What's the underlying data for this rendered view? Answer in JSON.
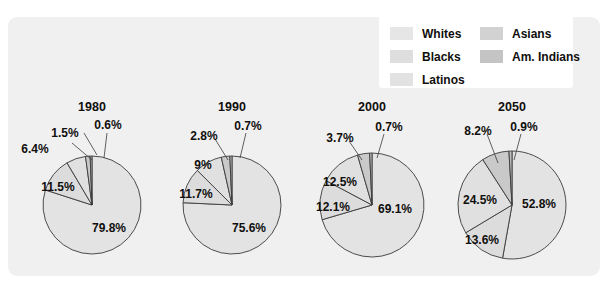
{
  "chart_data": {
    "type": "pie",
    "title": "",
    "subtitle": "",
    "xlabel": "",
    "ylabel": "",
    "grid": false,
    "legend_position": "top-right",
    "unit": "percent",
    "categories": [
      "Whites",
      "Blacks",
      "Latinos",
      "Asians",
      "Am. Indians"
    ],
    "panels": [
      {
        "label": "1980",
        "values": [
          79.8,
          11.5,
          6.4,
          1.5,
          0.6
        ],
        "value_labels": [
          "79.8%",
          "11.5%",
          "6.4%",
          "1.5%",
          "0.6%"
        ]
      },
      {
        "label": "1990",
        "values": [
          75.6,
          11.7,
          9.0,
          2.8,
          0.7
        ],
        "value_labels": [
          "75.6%",
          "11.7%",
          "9%",
          "2.8%",
          "0.7%"
        ]
      },
      {
        "label": "2000",
        "values": [
          69.1,
          12.1,
          12.5,
          3.7,
          0.7
        ],
        "value_labels": [
          "69.1%",
          "12.1%",
          "12.5%",
          "3.7%",
          "0.7%"
        ]
      },
      {
        "label": "2050",
        "values": [
          52.8,
          13.6,
          24.5,
          8.2,
          0.9
        ],
        "value_labels": [
          "52.8%",
          "13.6%",
          "24.5%",
          "8.2%",
          "0.9%"
        ]
      }
    ],
    "series_colors": [
      "#e3e3e3",
      "#dcdcdc",
      "#e0e0e0",
      "#c9c9c9",
      "#bdbdbd"
    ]
  },
  "legend": {
    "columns": [
      {
        "entries": [
          {
            "label": "Whites",
            "swatch": "#e6e6e6"
          },
          {
            "label": "Blacks",
            "swatch": "#dedede"
          },
          {
            "label": "Latinos",
            "swatch": "#e2e2e2"
          }
        ]
      },
      {
        "entries": [
          {
            "label": "Asians",
            "swatch": "#d2d2d2"
          },
          {
            "label": "Am. Indians",
            "swatch": "#c4c4c4"
          }
        ]
      }
    ]
  },
  "panel_style": {
    "background": "#f0f0f0",
    "outline": "#3a3a3a",
    "text": "#100f0d"
  },
  "years": {
    "y1980": "1980",
    "y1990": "1990",
    "y2000": "2000",
    "y2050": "2050"
  },
  "pie1": {
    "whites": "79.8%",
    "blacks": "11.5%",
    "latinos": "6.4%",
    "asians": "1.5%",
    "amindians": "0.6%"
  },
  "pie2": {
    "whites": "75.6%",
    "blacks": "11.7%",
    "latinos": "9%",
    "asians": "2.8%",
    "amindians": "0.7%"
  },
  "pie3": {
    "whites": "69.1%",
    "blacks": "12.1%",
    "latinos": "12.5%",
    "asians": "3.7%",
    "amindians": "0.7%"
  },
  "pie4": {
    "whites": "52.8%",
    "blacks": "13.6%",
    "latinos": "24.5%",
    "asians": "8.2%",
    "amindians": "0.9%"
  }
}
